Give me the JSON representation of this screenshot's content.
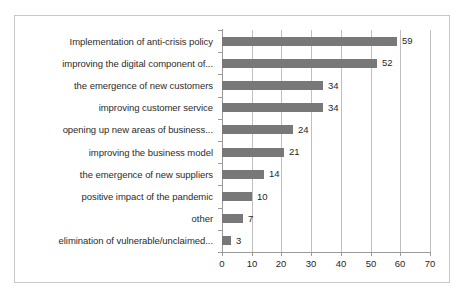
{
  "chart_data": {
    "type": "bar",
    "orientation": "horizontal",
    "title": "",
    "subtitle": "",
    "xlabel": "",
    "ylabel": "",
    "xlim": [
      0,
      70
    ],
    "xticks": [
      0,
      10,
      20,
      30,
      40,
      50,
      60,
      70
    ],
    "grid": true,
    "legend": false,
    "legend_position": "none",
    "categories": [
      "Implementation of anti-crisis policy",
      "improving the digital component of...",
      "the emergence of new customers",
      "improving customer service",
      "opening up new areas of business...",
      "improving the business model",
      "the emergence of new suppliers",
      "positive impact of the pandemic",
      "other",
      "elimination of vulnerable/unclaimed..."
    ],
    "values": [
      59,
      52,
      34,
      34,
      24,
      21,
      14,
      10,
      7,
      3
    ],
    "value_labels": [
      "59",
      "52",
      "34",
      "34",
      "24",
      "21",
      "14",
      "10",
      "7",
      "3"
    ],
    "tick_labels": [
      "0",
      "10",
      "20",
      "30",
      "40",
      "50",
      "60",
      "70"
    ],
    "colors": {
      "bar": "#787878",
      "gridline": "#bfbfbf",
      "axis": "#9a9a9a",
      "frame": "#c9c9c9",
      "text": "#1f1f1f",
      "category_text": "#2b2b2b",
      "background": "#ffffff"
    }
  }
}
